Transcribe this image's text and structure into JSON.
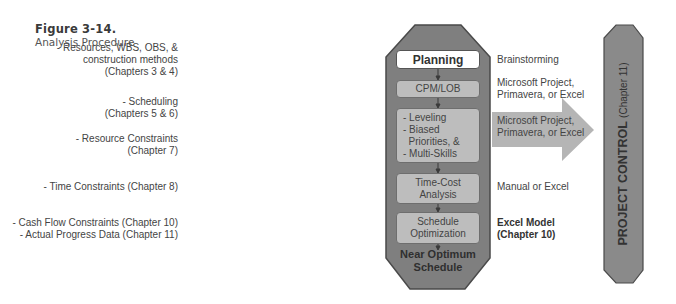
{
  "figure": {
    "number": "Figure 3-14.",
    "caption": "Analysis Procedure"
  },
  "inputs": [
    {
      "lines": [
        "- Resources, WBS, OBS, &",
        "construction methods",
        "(Chapters 3 & 4)"
      ]
    },
    {
      "lines": [
        "- Scheduling",
        "(Chapters 5 & 6)"
      ]
    },
    {
      "lines": [
        "- Resource Constraints",
        "(Chapter 7)"
      ]
    },
    {
      "lines": [
        "- Time Constraints (Chapter 8)"
      ]
    },
    {
      "lines": [
        "- Cash Flow Constraints (Chapter 10)",
        "- Actual Progress Data (Chapter 11)"
      ]
    }
  ],
  "steps": [
    {
      "label": "Planning"
    },
    {
      "label": "CPM/LOB"
    },
    {
      "lines": [
        "- Leveling",
        "- Biased",
        "  Priorities, &",
        "- Multi-Skills"
      ]
    },
    {
      "lines": [
        "Time-Cost",
        "Analysis"
      ]
    },
    {
      "lines": [
        "Schedule",
        "Optimization"
      ]
    }
  ],
  "output": {
    "lines": [
      "Near Optimum",
      "Schedule"
    ]
  },
  "tools": [
    {
      "lines": [
        "Brainstorming"
      ]
    },
    {
      "lines": [
        "Microsoft Project,",
        "Primavera, or Excel"
      ]
    },
    {
      "lines": [
        "Microsoft Project,",
        "Primavera, or Excel"
      ]
    },
    {
      "lines": [
        "Manual or Excel"
      ]
    },
    {
      "lines": [
        "Excel Model",
        "(Chapter 10)"
      ],
      "bold": true
    }
  ],
  "project_control": {
    "label": "PROJECT CONTROL",
    "sub": "(Chapter 11)"
  },
  "colors": {
    "octagon_fill": "#7f7f7f",
    "octagon_stroke": "#4a4a4a",
    "step_fill": "#bdbdbd",
    "planning_fill": "#ffffff",
    "arrow_fill": "#b5b5b5",
    "control_fill": "#8a8a8a"
  }
}
